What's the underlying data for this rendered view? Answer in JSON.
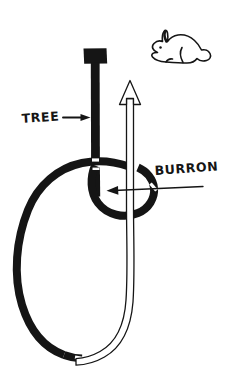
{
  "document": {
    "title": "Bowline knot mnemonic diagram",
    "background_color": "#ffffff",
    "ink_color": "#151515",
    "width": 238,
    "height": 384
  },
  "labels": {
    "tree": "TREE",
    "burron": "BURRON"
  },
  "figures": {
    "rabbit": "rabbit-illustration",
    "tree_post": "tree-post",
    "standing_loop": "standing-loop",
    "working_end": "working-end-rope",
    "up_arrow": "up-arrow",
    "tree_pointer": "tree-pointer-arrow",
    "burron_pointer": "burron-pointer-arrow"
  },
  "icons": {
    "arrow_right": "arrow-right-icon",
    "arrow_left": "arrow-left-icon",
    "arrow_up": "arrow-up-icon",
    "rabbit": "rabbit-icon"
  }
}
